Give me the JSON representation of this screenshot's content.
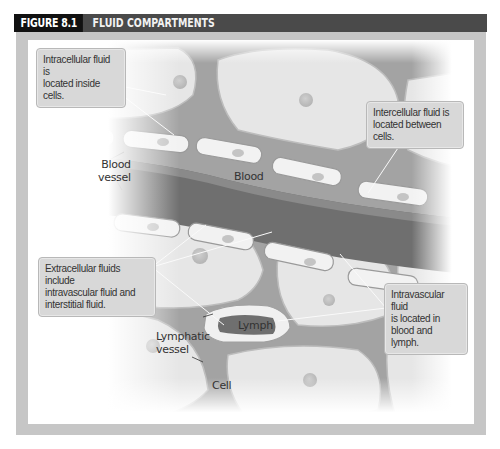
{
  "figure": {
    "number": "FIGURE 8.1",
    "title": "FLUID COMPARTMENTS"
  },
  "callouts": {
    "intracellular": [
      "Intracellular fluid is",
      "located inside cells."
    ],
    "intercellular": [
      "Intercellular fluid is",
      "located between cells."
    ],
    "extracellular": [
      "Extracellular fluids include",
      "intravascular fluid and",
      "interstitial fluid."
    ],
    "intravascular": [
      "Intravascular fluid",
      "is located in",
      "blood and lymph."
    ]
  },
  "labels": {
    "blood_vessel": [
      "Blood",
      "vessel"
    ],
    "blood": "Blood",
    "lymph": "Lymph",
    "lymphatic_vessel": [
      "Lymphatic",
      "vessel"
    ],
    "cell": "Cell"
  },
  "colors": {
    "header_dark": "#111111",
    "header_bar": "#4a4a4a",
    "frame_gray": "#c6c6c6",
    "callout_fill": "#d8d8d8",
    "interstitial": "#9a9a9a",
    "blood": "#6e6e6e",
    "cell_fill": "#e4e4e4"
  }
}
